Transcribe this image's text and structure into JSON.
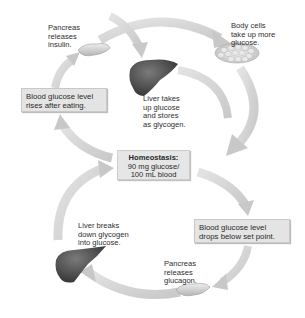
{
  "diagram": {
    "center": {
      "title": "Homeostasis:",
      "line1": "90 mg glucose/",
      "line2": "100 mL blood"
    },
    "upper_loop": {
      "stimulus": {
        "line1": "Blood glucose level",
        "line2": "rises after eating."
      },
      "pancreas": {
        "line1": "Pancreas",
        "line2": "releases",
        "line3": "insulin."
      },
      "body_cells": {
        "line1": "Body cells",
        "line2": "take up more",
        "line3": "glucose."
      },
      "liver": {
        "line1": "Liver takes",
        "line2": "up glucose",
        "line3": "and stores",
        "line4": "as glycogen."
      }
    },
    "lower_loop": {
      "stimulus": {
        "line1": "Blood glucose level",
        "line2": "drops below set point."
      },
      "pancreas": {
        "line1": "Pancreas",
        "line2": "releases",
        "line3": "glucagon."
      },
      "liver": {
        "line1": "Liver breaks",
        "line2": "down glycogen",
        "line3": "into glucose."
      }
    },
    "icons": [
      "pancreas-icon",
      "liver-icon",
      "body-cells-icon",
      "liver-icon",
      "pancreas-icon"
    ],
    "colors": {
      "arrow": "#d4d4d4",
      "arrow_edge": "#bdbdbd",
      "box_fill": "#e4e4e4",
      "liver": "#4a4a4a",
      "pancreas": "#cfcfcf"
    }
  }
}
